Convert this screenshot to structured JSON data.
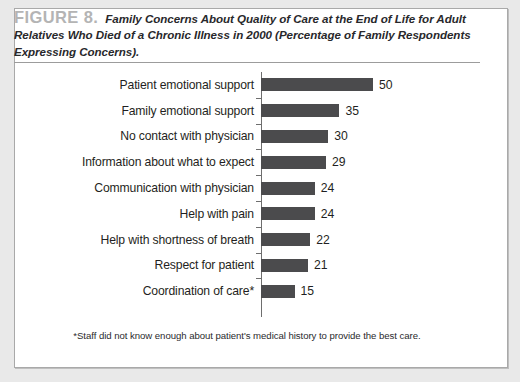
{
  "figure": {
    "number_label": "FIGURE 8.",
    "caption": "Family Concerns About Quality of Care at the End of Life for Adult Relatives Who Died of a Chronic Illness in 2000 (Percentage of Family Respondents Expressing Concerns).",
    "footnote": "*Staff did not know enough about patient's medical history to provide the best care.",
    "bar_color": "#4b4b4d",
    "number_color": "#b4b4b4",
    "text_color": "#1f1f22"
  },
  "chart_data": {
    "type": "bar",
    "orientation": "horizontal",
    "title": "Family Concerns About Quality of Care at the End of Life for Adult Relatives Who Died of a Chronic Illness in 2000 (Percentage of Family Respondents Expressing Concerns).",
    "xlabel": "",
    "ylabel": "",
    "xlim": [
      0,
      50
    ],
    "grid": false,
    "legend": false,
    "categories": [
      "Patient emotional support",
      "Family emotional support",
      "No contact with physician",
      "Information about what to expect",
      "Communication with physician",
      "Help with pain",
      "Help with shortness of breath",
      "Respect for patient",
      "Coordination of care*"
    ],
    "values": [
      50,
      35,
      30,
      29,
      24,
      24,
      22,
      21,
      15
    ],
    "value_labels": [
      "50",
      "35",
      "30",
      "29",
      "24",
      "24",
      "22",
      "21",
      "15"
    ]
  }
}
